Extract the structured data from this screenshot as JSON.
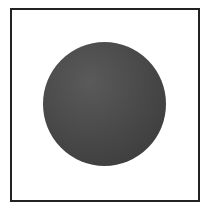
{
  "figure": {
    "frame_color": "#222222",
    "background_color": "#ffffff",
    "shape": "circle",
    "shape_color_light": "#5a5a5a",
    "shape_color_dark": "#3a3a3a"
  }
}
